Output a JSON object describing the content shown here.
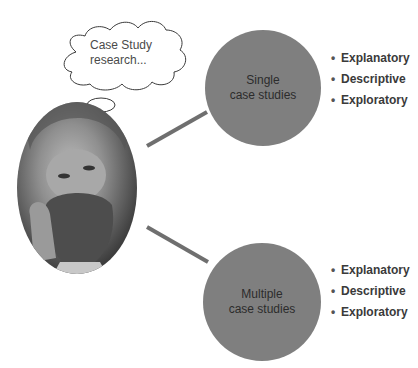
{
  "thought_bubble": {
    "line1": "Case Study",
    "line2": "research..."
  },
  "nodes": [
    {
      "line1": "Single",
      "line2": "case studies",
      "bullets": [
        "Explanatory",
        "Descriptive",
        "Exploratory"
      ]
    },
    {
      "line1": "Multiple",
      "line2": "case studies",
      "bullets": [
        "Explanatory",
        "Descriptive",
        "Exploratory"
      ]
    }
  ],
  "colors": {
    "circle_fill": "#7f7f7f",
    "connector": "#6f6f6f",
    "bullet_text": "#3a3a3a"
  },
  "portrait": {
    "description": "painted portrait of a bearded man in oval frame"
  }
}
